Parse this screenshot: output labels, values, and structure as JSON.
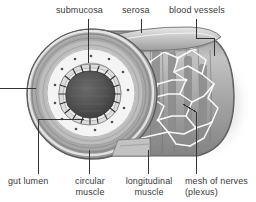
{
  "figure": {
    "kind": "anatomical-illustration",
    "style": "grayscale pen-and-ink diagram",
    "background_color": "#ffffff",
    "ink_color": "#3a3a3a",
    "leader_color": "#333333"
  },
  "labels": {
    "submucosa": "submucosa",
    "serosa": "serosa",
    "blood_vessels": "blood vessels",
    "gut_lumen": "gut lumen",
    "circular_muscle": "circular\nmuscle",
    "longitudinal_muscle": "longitudinal\nmuscle",
    "mesh_of_nerves": "mesh of nerves\n(plexus)"
  },
  "palette": {
    "outer_ring": "#9a9a9a",
    "muscle_band": "#b4b4b4",
    "submucosa_band": "#f1f1f1",
    "mucosa_band": "#d8d8d8",
    "lumen": "#4b4b4b",
    "nerve_mesh": "#ffffff",
    "shadow": "#d9d9d9",
    "serosa_flap": "#c9c9c9"
  }
}
